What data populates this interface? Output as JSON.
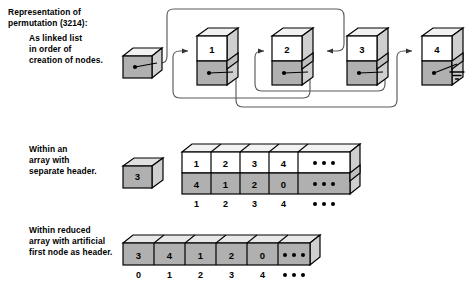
{
  "title": "Representation of\npermutation (3214):",
  "captions": {
    "linked_list": "As linked list\nin order of\ncreation of nodes.",
    "array_header": "Within an\narray with\nseparate header.",
    "reduced_array": "Within reduced\narray with artificial\nfirst node as header."
  },
  "permutation": "3214",
  "colors": {
    "node_fill_gray": "#b0b0b0",
    "node_fill_white": "#ffffff",
    "top_face": "#f2f2f2",
    "side_face": "#d4d4d4",
    "outline": "#000000",
    "link_line": "#555555",
    "background": "#ffffff"
  },
  "linked_list": {
    "header_node": {
      "label": "",
      "has_pointer_dot": true
    },
    "nodes": [
      {
        "key": "1",
        "has_pointer_dot": true
      },
      {
        "key": "2",
        "has_pointer_dot": true
      },
      {
        "key": "3",
        "has_pointer_dot": true
      },
      {
        "key": "4",
        "has_pointer_dot": true
      }
    ],
    "terminator": "ground-symbol",
    "links": [
      {
        "from": "header",
        "to": "3"
      },
      {
        "from": "1",
        "to": "4"
      },
      {
        "from": "2",
        "to": "1"
      },
      {
        "from": "3",
        "to": "2"
      },
      {
        "from": "4",
        "to": "null"
      }
    ]
  },
  "array_with_header": {
    "header_cell": "3",
    "top_row": [
      "1",
      "2",
      "3",
      "4",
      "•••"
    ],
    "bottom_row": [
      "4",
      "1",
      "2",
      "0",
      "•••"
    ],
    "index_labels": [
      "1",
      "2",
      "3",
      "4",
      "•••"
    ]
  },
  "reduced_array": {
    "cells": [
      "3",
      "4",
      "1",
      "2",
      "0",
      "•••"
    ],
    "index_labels": [
      "0",
      "1",
      "2",
      "3",
      "4",
      "•••"
    ]
  }
}
